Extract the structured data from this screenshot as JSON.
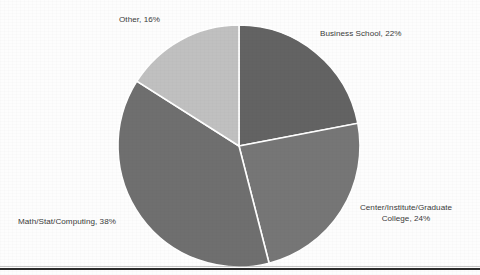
{
  "chart_data": {
    "type": "pie",
    "title": "",
    "subtitle": "",
    "xlabel": "",
    "ylabel": "",
    "legend_position": "none",
    "labels_position": "outside",
    "grid": false,
    "categories": [
      "Business School",
      "Center/Institute/Graduate College",
      "Math/Stat/Computing",
      "Other"
    ],
    "values": [
      22,
      24,
      38,
      16
    ],
    "value_unit": "%",
    "start_angle_deg": 0,
    "direction": "clockwise",
    "slice_colors": [
      "#636363",
      "#767676",
      "#6f6f6f",
      "#c0c0c0"
    ],
    "slice_border_color": "#ffffff",
    "data_labels": [
      {
        "text": "Business School, 22%",
        "category": "Business School",
        "value": 22
      },
      {
        "line1": "Center/Institute/Graduate",
        "line2": "College, 24%",
        "category": "Center/Institute/Graduate College",
        "value": 24
      },
      {
        "text": "Math/Stat/Computing, 38%",
        "category": "Math/Stat/Computing",
        "value": 38
      },
      {
        "text": "Other, 16%",
        "category": "Other",
        "value": 16
      }
    ]
  },
  "figure": {
    "background_color": "#fdfdfd",
    "label_text_color": "#3a3a3a",
    "rule_color": "#2b2b2b"
  }
}
